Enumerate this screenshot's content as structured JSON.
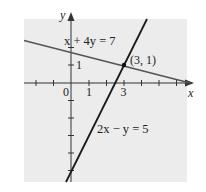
{
  "figure": {
    "panel_color": "#ececec",
    "line_color": "#222222",
    "secondary_line_color": "#444444",
    "axes": {
      "x_label": "x",
      "y_label": "y",
      "x_tick_labels": [
        {
          "value": 0,
          "label": "0"
        },
        {
          "value": 1,
          "label": "1"
        },
        {
          "value": 3,
          "label": "3"
        }
      ],
      "y_tick_labels": [
        {
          "value": 1,
          "label": "1"
        }
      ],
      "x_ticks": [
        -2,
        -1,
        1,
        2,
        3,
        4,
        5,
        6
      ],
      "y_ticks": [
        2,
        1,
        -1,
        -2,
        -3,
        -4,
        -5
      ]
    },
    "lines": [
      {
        "equation": "x + 4y = 7",
        "label": "x + 4y = 7"
      },
      {
        "equation": "2x − y = 5",
        "label": "2x − y = 5"
      }
    ],
    "intersection": {
      "x": 3,
      "y": 1,
      "label": "(3, 1)"
    }
  }
}
